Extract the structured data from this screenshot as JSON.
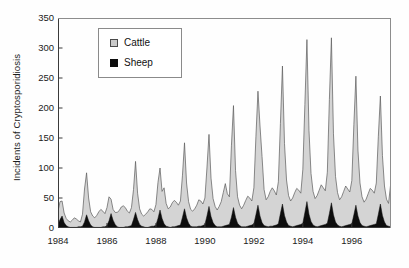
{
  "chart_data": {
    "type": "area",
    "title": "",
    "subtitle": "",
    "xlabel": "",
    "ylabel": "Incidents of Cryptosporidiosis",
    "stacked": true,
    "grid": false,
    "legend_position": "top-left-inside",
    "xlim": [
      1984.0,
      1997.6
    ],
    "ylim": [
      0,
      350
    ],
    "yticks": [
      0,
      50,
      100,
      150,
      200,
      250,
      300,
      350
    ],
    "ytick_labels": [
      "0",
      "50",
      "100",
      "150",
      "200",
      "250",
      "300",
      "350"
    ],
    "xticks": [
      1984,
      1986,
      1988,
      1990,
      1992,
      1994,
      1996
    ],
    "xtick_labels": [
      "1984",
      "1986",
      "1988",
      "1990",
      "1992",
      "1994",
      "1996"
    ],
    "x_interval": "monthly",
    "colors": {
      "cattle": "#d4d4d4",
      "sheep": "#0d0d0d",
      "outline": "#5a5a5a",
      "axis": "#3a3a3a",
      "text": "#1b1b1b"
    },
    "legend_entries": [
      {
        "label": "Cattle",
        "color": "#d4d4d4",
        "swatch": "gray-square"
      },
      {
        "label": "Sheep",
        "color": "#0d0d0d",
        "swatch": "black-square"
      }
    ],
    "series": [
      {
        "name": "Sheep",
        "color": "#0d0d0d",
        "values": [
          6,
          14,
          20,
          9,
          4,
          2,
          1,
          1,
          1,
          1,
          2,
          2,
          3,
          10,
          22,
          12,
          5,
          2,
          1,
          1,
          1,
          1,
          2,
          2,
          4,
          12,
          24,
          13,
          6,
          2,
          1,
          1,
          1,
          2,
          2,
          3,
          4,
          14,
          26,
          14,
          6,
          3,
          2,
          1,
          1,
          2,
          3,
          3,
          5,
          16,
          30,
          16,
          7,
          3,
          2,
          1,
          2,
          2,
          3,
          4,
          5,
          18,
          32,
          17,
          8,
          3,
          2,
          2,
          2,
          3,
          3,
          4,
          6,
          20,
          36,
          19,
          9,
          4,
          2,
          2,
          2,
          3,
          4,
          5,
          6,
          18,
          34,
          18,
          8,
          4,
          2,
          2,
          2,
          3,
          4,
          5,
          7,
          22,
          38,
          20,
          9,
          4,
          3,
          2,
          3,
          3,
          4,
          5,
          7,
          24,
          40,
          21,
          10,
          4,
          3,
          2,
          3,
          4,
          5,
          6,
          8,
          26,
          44,
          23,
          11,
          5,
          3,
          2,
          3,
          4,
          5,
          6,
          8,
          24,
          42,
          22,
          10,
          5,
          3,
          2,
          3,
          4,
          5,
          6,
          7,
          22,
          38,
          20,
          9,
          4,
          3,
          2,
          3,
          4,
          5,
          6,
          7,
          23,
          40,
          21,
          10,
          4,
          3,
          2,
          3,
          4,
          5,
          6
        ]
      },
      {
        "name": "Cattle",
        "color": "#d4d4d4",
        "values": [
          22,
          30,
          25,
          16,
          12,
          10,
          9,
          12,
          16,
          14,
          10,
          8,
          20,
          55,
          70,
          38,
          22,
          18,
          16,
          20,
          26,
          30,
          26,
          22,
          30,
          40,
          24,
          18,
          20,
          24,
          28,
          34,
          36,
          32,
          26,
          22,
          30,
          50,
          85,
          44,
          26,
          20,
          18,
          22,
          26,
          30,
          28,
          24,
          34,
          60,
          70,
          45,
          60,
          38,
          30,
          34,
          40,
          44,
          40,
          34,
          40,
          70,
          110,
          58,
          36,
          28,
          26,
          30,
          36,
          44,
          42,
          36,
          44,
          80,
          120,
          64,
          40,
          32,
          28,
          34,
          42,
          56,
          70,
          52,
          46,
          120,
          170,
          78,
          44,
          34,
          30,
          36,
          44,
          50,
          46,
          40,
          60,
          130,
          190,
          150,
          110,
          60,
          44,
          50,
          58,
          64,
          58,
          50,
          70,
          150,
          230,
          120,
          70,
          50,
          42,
          48,
          56,
          62,
          58,
          52,
          90,
          180,
          270,
          140,
          80,
          56,
          46,
          52,
          60,
          68,
          62,
          56,
          85,
          190,
          275,
          135,
          76,
          54,
          44,
          50,
          58,
          66,
          60,
          54,
          72,
          150,
          215,
          110,
          66,
          48,
          40,
          46,
          54,
          62,
          58,
          52,
          68,
          130,
          180,
          100,
          60,
          44,
          38,
          70,
          100,
          64,
          56,
          50
        ]
      }
    ]
  },
  "legend": {
    "cattle_label": "Cattle",
    "sheep_label": "Sheep"
  },
  "axes": {
    "y_title": "Incidents of Cryptosporidiosis"
  }
}
